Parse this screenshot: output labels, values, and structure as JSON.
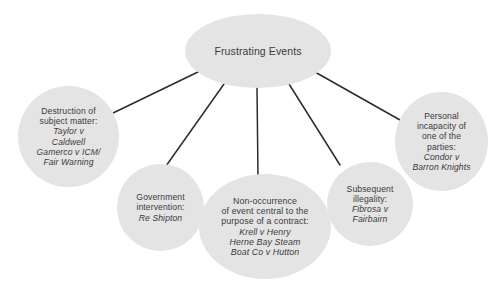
{
  "diagram": {
    "type": "mind-map",
    "root": {
      "id": "frustrating-events",
      "label": "Frustrating Events"
    },
    "branches": [
      {
        "id": "destruction",
        "heading": "Destruction of subject matter:",
        "cases": "Taylor v Caldwell\nGamerco v ICM/\nFair Warning",
        "case_lines": [
          "Taylor v",
          "Caldwell",
          "Gamerco v ICM/",
          "Fair Warning"
        ],
        "heading_lines": [
          "Destruction of",
          "subject matter:"
        ]
      },
      {
        "id": "government-intervention",
        "heading": "Government intervention:",
        "cases": "Re Shipton",
        "case_lines": [
          "Re Shipton"
        ],
        "heading_lines": [
          "Government",
          "intervention:"
        ]
      },
      {
        "id": "non-occurrence",
        "heading": "Non-occurrence of event central to the purpose of a contract:",
        "cases": "Krell v Henry\nHerne Bay Steam\nBoat Co v Hutton",
        "case_lines": [
          "Krell v Henry",
          "Herne Bay Steam",
          "Boat Co v Hutton"
        ],
        "heading_lines": [
          "Non-occurrence",
          "of event central to the",
          "purpose of a contract:"
        ]
      },
      {
        "id": "subsequent-illegality",
        "heading": "Subsequent illegality:",
        "cases": "Fibrosa v Fairbairn",
        "case_lines": [
          "Fibrosa v",
          "Fairbairn"
        ],
        "heading_lines": [
          "Subsequent",
          "illegality:"
        ]
      },
      {
        "id": "personal-incapacity",
        "heading": "Personal incapacity of one of the parties:",
        "cases": "Condor v Barron Knights",
        "case_lines": [
          "Condor v",
          "Barron Knights"
        ],
        "heading_lines": [
          "Personal",
          "incapacity of",
          "one of the",
          "parties:"
        ]
      }
    ],
    "style": {
      "node_fill": "#e4e4e4",
      "text_color": "#3b3b3b",
      "connector_color": "#2b2b2b",
      "background": "#ffffff"
    }
  }
}
